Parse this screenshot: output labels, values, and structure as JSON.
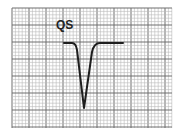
{
  "diagram": {
    "title": "QS",
    "type": "ecg-waveform",
    "colors": {
      "background": "#ffffff",
      "minor_grid": "#b8b8b8",
      "major_grid": "#6e6e6e",
      "trace": "#1e1e1e"
    },
    "grid": {
      "x0": 12,
      "y0": 8,
      "x1": 172,
      "y1": 128,
      "minor_step": 3.4,
      "major_every": 5
    }
  }
}
